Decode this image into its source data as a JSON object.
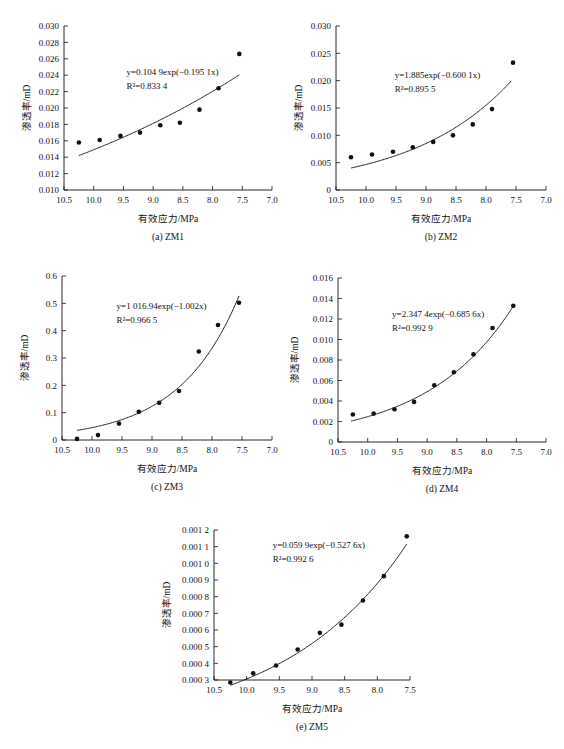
{
  "figure": {
    "axis_titles": {
      "x": "有效应力/MPa",
      "y": "渗透率/mD"
    },
    "captions": {
      "a": "(a) ZM1",
      "b": "(b) ZM2",
      "c": "(c) ZM3",
      "d": "(d) ZM4",
      "e": "(e) ZM5"
    }
  },
  "chart_data": [
    {
      "id": "a",
      "type": "scatter",
      "title": "(a) ZM1",
      "xlabel": "有效应力/MPa",
      "ylabel": "渗透率/mD",
      "xlim": [
        10.5,
        7.0
      ],
      "ylim": [
        0.01,
        0.03
      ],
      "x_ticks": [
        "10.5",
        "10.0",
        "9.5",
        "9.0",
        "8.5",
        "8.0",
        "7.5",
        "7.0"
      ],
      "x_tick_values": [
        10.5,
        10.0,
        9.5,
        9.0,
        8.5,
        8.0,
        7.5,
        7.0
      ],
      "y_ticks": [
        "0.010",
        "0.012",
        "0.014",
        "0.016",
        "0.018",
        "0.020",
        "0.022",
        "0.024",
        "0.026",
        "0.028",
        "0.030"
      ],
      "y_tick_values": [
        0.01,
        0.012,
        0.014,
        0.016,
        0.018,
        0.02,
        0.022,
        0.024,
        0.026,
        0.028,
        0.03
      ],
      "grid": false,
      "legend": "none",
      "equation": "y=0.104 9exp(−0.195 1x)",
      "r_squared": "R²=0.833 4",
      "fit": {
        "a": 0.1049,
        "b": -0.1951,
        "x_from": 10.25,
        "x_to": 7.55
      },
      "x": [
        10.25,
        9.9,
        9.55,
        9.22,
        8.88,
        8.55,
        8.22,
        7.9,
        7.55
      ],
      "y": [
        0.0158,
        0.0161,
        0.0166,
        0.017,
        0.0179,
        0.0182,
        0.0198,
        0.0224,
        0.0266
      ]
    },
    {
      "id": "b",
      "type": "scatter",
      "title": "(b) ZM2",
      "xlabel": "有效应力/MPa",
      "ylabel": "渗透率/mD",
      "xlim": [
        10.5,
        7.0
      ],
      "ylim": [
        0,
        0.03
      ],
      "x_ticks": [
        "10.5",
        "10.0",
        "9.5",
        "9.0",
        "8.5",
        "8.0",
        "7.5",
        "7.0"
      ],
      "x_tick_values": [
        10.5,
        10.0,
        9.5,
        9.0,
        8.5,
        8.0,
        7.5,
        7.0
      ],
      "y_ticks": [
        "0",
        "0.005",
        "0.010",
        "0.015",
        "0.020",
        "0.025",
        "0.030"
      ],
      "y_tick_values": [
        0,
        0.005,
        0.01,
        0.015,
        0.02,
        0.025,
        0.03
      ],
      "grid": false,
      "legend": "none",
      "equation": "y=1.885exp(−0.600 1x)",
      "r_squared": "R²=0.895 5",
      "fit": {
        "a": 1.885,
        "b": -0.6001,
        "x_from": 10.25,
        "x_to": 7.58
      },
      "x": [
        10.25,
        9.9,
        9.55,
        9.22,
        8.88,
        8.55,
        8.22,
        7.9,
        7.55
      ],
      "y": [
        0.006,
        0.0065,
        0.007,
        0.0078,
        0.0088,
        0.01,
        0.012,
        0.0148,
        0.0233
      ]
    },
    {
      "id": "c",
      "type": "scatter",
      "title": "(c) ZM3",
      "xlabel": "有效应力/MPa",
      "ylabel": "渗透率/mD",
      "xlim": [
        10.5,
        7.0
      ],
      "ylim": [
        0,
        0.6
      ],
      "x_ticks": [
        "10.5",
        "10.0",
        "9.5",
        "9.0",
        "8.5",
        "8.0",
        "7.5",
        "7.0"
      ],
      "x_tick_values": [
        10.5,
        10.0,
        9.5,
        9.0,
        8.5,
        8.0,
        7.5,
        7.0
      ],
      "y_ticks": [
        "0",
        "0.1",
        "0.2",
        "0.3",
        "0.4",
        "0.5",
        "0.6"
      ],
      "y_tick_values": [
        0,
        0.1,
        0.2,
        0.3,
        0.4,
        0.5,
        0.6
      ],
      "grid": false,
      "legend": "none",
      "equation": "y=1 016.94exp(−1.002x)",
      "r_squared": "R²=0.966 5",
      "fit": {
        "a": 1016.94,
        "b": -1.002,
        "x_from": 10.25,
        "x_to": 7.55
      },
      "x": [
        10.25,
        9.9,
        9.55,
        9.22,
        8.88,
        8.55,
        8.22,
        7.9,
        7.55
      ],
      "y": [
        0.004,
        0.018,
        0.06,
        0.103,
        0.136,
        0.179,
        0.324,
        0.421,
        0.502
      ]
    },
    {
      "id": "d",
      "type": "scatter",
      "title": "(d) ZM4",
      "xlabel": "有效应力/MPa",
      "ylabel": "渗透率/mD",
      "xlim": [
        10.5,
        7.0
      ],
      "ylim": [
        0,
        0.016
      ],
      "x_ticks": [
        "10.5",
        "10.0",
        "9.5",
        "9.0",
        "8.5",
        "8.0",
        "7.5",
        "7.0"
      ],
      "x_tick_values": [
        10.5,
        10.0,
        9.5,
        9.0,
        8.5,
        8.0,
        7.5,
        7.0
      ],
      "y_ticks": [
        "0",
        "0.002",
        "0.004",
        "0.006",
        "0.008",
        "0.010",
        "0.012",
        "0.014",
        "0.016"
      ],
      "y_tick_values": [
        0,
        0.002,
        0.004,
        0.006,
        0.008,
        0.01,
        0.012,
        0.014,
        0.016
      ],
      "grid": false,
      "legend": "none",
      "equation": "y=2.347 4exp(−0.685 6x)",
      "r_squared": "R²=0.992 9",
      "fit": {
        "a": 2.3474,
        "b": -0.6856,
        "x_from": 10.28,
        "x_to": 7.55
      },
      "x": [
        10.25,
        9.9,
        9.55,
        9.22,
        8.88,
        8.55,
        8.22,
        7.9,
        7.55
      ],
      "y": [
        0.00268,
        0.00277,
        0.0032,
        0.00391,
        0.00553,
        0.00681,
        0.00855,
        0.01112,
        0.0133
      ]
    },
    {
      "id": "e",
      "type": "scatter",
      "title": "(e) ZM5",
      "xlabel": "有效应力/MPa",
      "ylabel": "渗透率/mD",
      "xlim": [
        10.5,
        7.5
      ],
      "ylim": [
        0.0003,
        0.0012
      ],
      "x_ticks": [
        "10.5",
        "10.0",
        "9.5",
        "9.0",
        "8.5",
        "8.0",
        "7.5"
      ],
      "x_tick_values": [
        10.5,
        10.0,
        9.5,
        9.0,
        8.5,
        8.0,
        7.5
      ],
      "y_ticks": [
        "0.000 3",
        "0.000 4",
        "0.000 5",
        "0.000 6",
        "0.000 7",
        "0.000 8",
        "0.000 9",
        "0.001 0",
        "0.001 1",
        "0.001 2"
      ],
      "y_tick_values": [
        0.0003,
        0.0004,
        0.0005,
        0.0006,
        0.0007,
        0.0008,
        0.0009,
        0.001,
        0.0011,
        0.0012
      ],
      "grid": false,
      "legend": "none",
      "equation": "y=0.059 9exp(−0.527 6x)",
      "r_squared": "R²=0.992 6",
      "fit": {
        "a": 0.0599,
        "b": -0.5276,
        "x_from": 10.25,
        "x_to": 7.55
      },
      "x": [
        10.25,
        9.9,
        9.55,
        9.22,
        8.88,
        8.55,
        8.22,
        7.9,
        7.55
      ],
      "y": [
        0.000285,
        0.00034,
        0.000387,
        0.000483,
        0.000583,
        0.000632,
        0.000777,
        0.000923,
        0.001162
      ]
    }
  ]
}
